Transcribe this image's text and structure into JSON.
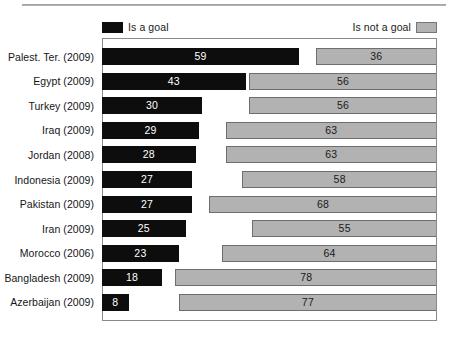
{
  "chart_data": {
    "type": "bar",
    "title": "",
    "subtitle": "",
    "xlabel": "",
    "ylabel": "",
    "orientation": "horizontal",
    "stacked": true,
    "grid": false,
    "xlim": [
      0,
      100
    ],
    "legend_position": "top",
    "legend": [
      {
        "name": "Is a goal",
        "color": "#0d0d0d",
        "swatch": "black"
      },
      {
        "name": "Is not a goal",
        "color": "#b2b2b2",
        "swatch": "gray"
      }
    ],
    "categories": [
      "Palest. Ter. (2009)",
      "Egypt (2009)",
      "Turkey (2009)",
      "Iraq (2009)",
      "Jordan (2008)",
      "Indonesia (2009)",
      "Pakistan (2009)",
      "Iran (2009)",
      "Morocco (2006)",
      "Bangladesh (2009)",
      "Azerbaijan (2009)"
    ],
    "series": [
      {
        "name": "Is a goal",
        "color": "#0d0d0d",
        "values": [
          59,
          43,
          30,
          29,
          28,
          27,
          27,
          25,
          23,
          18,
          8
        ]
      },
      {
        "name": "Is not a goal",
        "color": "#b2b2b2",
        "values": [
          36,
          56,
          56,
          63,
          63,
          58,
          68,
          55,
          64,
          78,
          77
        ]
      }
    ],
    "rows": [
      {
        "category": "Palest. Ter. (2009)",
        "goal": 59,
        "not_goal": 36
      },
      {
        "category": "Egypt (2009)",
        "goal": 43,
        "not_goal": 56
      },
      {
        "category": "Turkey (2009)",
        "goal": 30,
        "not_goal": 56
      },
      {
        "category": "Iraq (2009)",
        "goal": 29,
        "not_goal": 63
      },
      {
        "category": "Jordan (2008)",
        "goal": 28,
        "not_goal": 63
      },
      {
        "category": "Indonesia (2009)",
        "goal": 27,
        "not_goal": 58
      },
      {
        "category": "Pakistan (2009)",
        "goal": 27,
        "not_goal": 68
      },
      {
        "category": "Iran (2009)",
        "goal": 25,
        "not_goal": 55
      },
      {
        "category": "Morocco (2006)",
        "goal": 23,
        "not_goal": 64
      },
      {
        "category": "Bangladesh (2009)",
        "goal": 18,
        "not_goal": 78
      },
      {
        "category": "Azerbaijan (2009)",
        "goal": 8,
        "not_goal": 77
      }
    ]
  },
  "legend": {
    "left_label": "Is a goal",
    "right_label": "Is not a goal"
  },
  "colors": {
    "goal": "#0d0d0d",
    "not_goal": "#b2b2b2",
    "frame": "#8a8a8a",
    "text": "#1a1a1a"
  }
}
